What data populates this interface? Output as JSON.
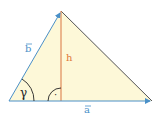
{
  "diagram": {
    "labels": {
      "side_b": "b",
      "side_a": "a",
      "height": "h",
      "angle_gamma": "γ",
      "right_angle_dot": "·"
    },
    "colors": {
      "fill": "#fdf8d8",
      "vector": "#4a90c8",
      "edge": "#555555",
      "height": "#e08a5a",
      "text_blue": "#4a90c8",
      "text_orange": "#e07a3a",
      "arc": "#222222"
    },
    "vertices": {
      "C": [
        9,
        101
      ],
      "apex": [
        61,
        11
      ],
      "B": [
        152,
        101
      ]
    }
  }
}
